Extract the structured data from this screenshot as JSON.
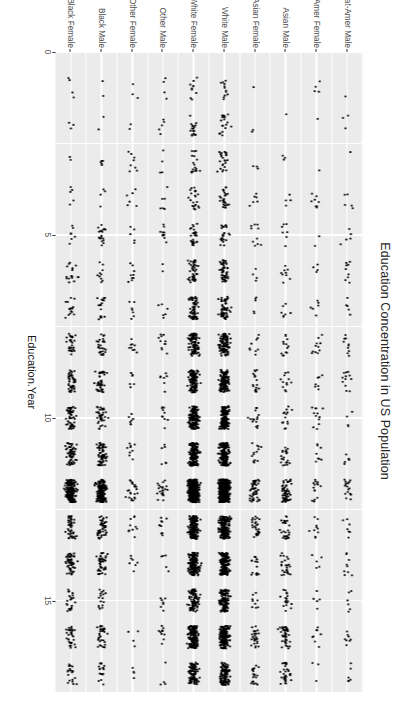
{
  "figure": {
    "title": "Education Concentration in US Population",
    "background": "#ffffff",
    "panel_background": "#ebebeb",
    "grid_color": "#ffffff",
    "point_color": "#000000",
    "axis_text_color": "#4d4d4d"
  },
  "chart_data": {
    "type": "scatter",
    "title": "Education Concentration in US Population",
    "subtitle": "",
    "orientation": "horizontal-strip",
    "xlabel": "Education.Year",
    "ylabel": "Race.Sex",
    "xlim": [
      0,
      17.5
    ],
    "ylim_categories": true,
    "grid": true,
    "legend": "none",
    "x_ticks": [
      {
        "value": 0,
        "label": "0"
      },
      {
        "value": 5,
        "label": "5"
      },
      {
        "value": 10,
        "label": "10"
      },
      {
        "value": 15,
        "label": "15"
      }
    ],
    "x_minor_ticks": [
      2.5,
      7.5,
      12.5
    ],
    "categories": [
      "Black Female",
      "Black Male",
      "Other Female",
      "Other Male",
      "White Female",
      "White Male",
      "Asian Female",
      "Asian Male",
      "Nat-Amer Female",
      "Nat-Amer Male"
    ],
    "series": [
      {
        "name": "Black Female",
        "n_points": 620,
        "density_scale": 0.62,
        "education_year_distribution": [
          {
            "year": 1,
            "weight": 0.004
          },
          {
            "year": 2,
            "weight": 0.006
          },
          {
            "year": 3,
            "weight": 0.008
          },
          {
            "year": 4,
            "weight": 0.012
          },
          {
            "year": 5,
            "weight": 0.014
          },
          {
            "year": 6,
            "weight": 0.022
          },
          {
            "year": 7,
            "weight": 0.028
          },
          {
            "year": 8,
            "weight": 0.05
          },
          {
            "year": 9,
            "weight": 0.07
          },
          {
            "year": 10,
            "weight": 0.085
          },
          {
            "year": 11,
            "weight": 0.1
          },
          {
            "year": 12,
            "weight": 0.3
          },
          {
            "year": 13,
            "weight": 0.095
          },
          {
            "year": 14,
            "weight": 0.085
          },
          {
            "year": 15,
            "weight": 0.035
          },
          {
            "year": 16,
            "weight": 0.055
          },
          {
            "year": 17,
            "weight": 0.031
          }
        ]
      },
      {
        "name": "Black Male",
        "n_points": 560,
        "density_scale": 0.58,
        "education_year_distribution": [
          {
            "year": 1,
            "weight": 0.004
          },
          {
            "year": 2,
            "weight": 0.006
          },
          {
            "year": 3,
            "weight": 0.01
          },
          {
            "year": 4,
            "weight": 0.014
          },
          {
            "year": 5,
            "weight": 0.016
          },
          {
            "year": 6,
            "weight": 0.024
          },
          {
            "year": 7,
            "weight": 0.03
          },
          {
            "year": 8,
            "weight": 0.055
          },
          {
            "year": 9,
            "weight": 0.075
          },
          {
            "year": 10,
            "weight": 0.09
          },
          {
            "year": 11,
            "weight": 0.1
          },
          {
            "year": 12,
            "weight": 0.3
          },
          {
            "year": 13,
            "weight": 0.09
          },
          {
            "year": 14,
            "weight": 0.075
          },
          {
            "year": 15,
            "weight": 0.03
          },
          {
            "year": 16,
            "weight": 0.048
          },
          {
            "year": 17,
            "weight": 0.033
          }
        ]
      },
      {
        "name": "Other Female",
        "n_points": 120,
        "density_scale": 0.12,
        "education_year_distribution": [
          {
            "year": 1,
            "weight": 0.02
          },
          {
            "year": 2,
            "weight": 0.02
          },
          {
            "year": 3,
            "weight": 0.03
          },
          {
            "year": 4,
            "weight": 0.035
          },
          {
            "year": 5,
            "weight": 0.04
          },
          {
            "year": 6,
            "weight": 0.05
          },
          {
            "year": 7,
            "weight": 0.05
          },
          {
            "year": 8,
            "weight": 0.06
          },
          {
            "year": 9,
            "weight": 0.07
          },
          {
            "year": 10,
            "weight": 0.075
          },
          {
            "year": 11,
            "weight": 0.08
          },
          {
            "year": 12,
            "weight": 0.17
          },
          {
            "year": 13,
            "weight": 0.08
          },
          {
            "year": 14,
            "weight": 0.08
          },
          {
            "year": 15,
            "weight": 0.045
          },
          {
            "year": 16,
            "weight": 0.06
          },
          {
            "year": 17,
            "weight": 0.035
          }
        ]
      },
      {
        "name": "Other Male",
        "n_points": 130,
        "density_scale": 0.13,
        "education_year_distribution": [
          {
            "year": 1,
            "weight": 0.02
          },
          {
            "year": 2,
            "weight": 0.022
          },
          {
            "year": 3,
            "weight": 0.03
          },
          {
            "year": 4,
            "weight": 0.04
          },
          {
            "year": 5,
            "weight": 0.045
          },
          {
            "year": 6,
            "weight": 0.05
          },
          {
            "year": 7,
            "weight": 0.05
          },
          {
            "year": 8,
            "weight": 0.06
          },
          {
            "year": 9,
            "weight": 0.07
          },
          {
            "year": 10,
            "weight": 0.075
          },
          {
            "year": 11,
            "weight": 0.08
          },
          {
            "year": 12,
            "weight": 0.16
          },
          {
            "year": 13,
            "weight": 0.08
          },
          {
            "year": 14,
            "weight": 0.075
          },
          {
            "year": 15,
            "weight": 0.045
          },
          {
            "year": 16,
            "weight": 0.058
          },
          {
            "year": 17,
            "weight": 0.045
          }
        ]
      },
      {
        "name": "White Female",
        "n_points": 2100,
        "density_scale": 1.0,
        "education_year_distribution": [
          {
            "year": 1,
            "weight": 0.004
          },
          {
            "year": 2,
            "weight": 0.006
          },
          {
            "year": 3,
            "weight": 0.009
          },
          {
            "year": 4,
            "weight": 0.012
          },
          {
            "year": 5,
            "weight": 0.016
          },
          {
            "year": 6,
            "weight": 0.022
          },
          {
            "year": 7,
            "weight": 0.028
          },
          {
            "year": 8,
            "weight": 0.05
          },
          {
            "year": 9,
            "weight": 0.06
          },
          {
            "year": 10,
            "weight": 0.07
          },
          {
            "year": 11,
            "weight": 0.085
          },
          {
            "year": 12,
            "weight": 0.28
          },
          {
            "year": 13,
            "weight": 0.095
          },
          {
            "year": 14,
            "weight": 0.09
          },
          {
            "year": 15,
            "weight": 0.04
          },
          {
            "year": 16,
            "weight": 0.08
          },
          {
            "year": 17,
            "weight": 0.053
          }
        ]
      },
      {
        "name": "White Male",
        "n_points": 2250,
        "density_scale": 1.0,
        "education_year_distribution": [
          {
            "year": 1,
            "weight": 0.005
          },
          {
            "year": 2,
            "weight": 0.007
          },
          {
            "year": 3,
            "weight": 0.01
          },
          {
            "year": 4,
            "weight": 0.013
          },
          {
            "year": 5,
            "weight": 0.017
          },
          {
            "year": 6,
            "weight": 0.023
          },
          {
            "year": 7,
            "weight": 0.03
          },
          {
            "year": 8,
            "weight": 0.05
          },
          {
            "year": 9,
            "weight": 0.062
          },
          {
            "year": 10,
            "weight": 0.072
          },
          {
            "year": 11,
            "weight": 0.085
          },
          {
            "year": 12,
            "weight": 0.27
          },
          {
            "year": 13,
            "weight": 0.09
          },
          {
            "year": 14,
            "weight": 0.088
          },
          {
            "year": 15,
            "weight": 0.042
          },
          {
            "year": 16,
            "weight": 0.082
          },
          {
            "year": 17,
            "weight": 0.054
          }
        ]
      },
      {
        "name": "Asian Female",
        "n_points": 240,
        "density_scale": 0.24,
        "education_year_distribution": [
          {
            "year": 1,
            "weight": 0.008
          },
          {
            "year": 2,
            "weight": 0.01
          },
          {
            "year": 3,
            "weight": 0.014
          },
          {
            "year": 4,
            "weight": 0.018
          },
          {
            "year": 5,
            "weight": 0.02
          },
          {
            "year": 6,
            "weight": 0.028
          },
          {
            "year": 7,
            "weight": 0.03
          },
          {
            "year": 8,
            "weight": 0.04
          },
          {
            "year": 9,
            "weight": 0.05
          },
          {
            "year": 10,
            "weight": 0.055
          },
          {
            "year": 11,
            "weight": 0.06
          },
          {
            "year": 12,
            "weight": 0.2
          },
          {
            "year": 13,
            "weight": 0.08
          },
          {
            "year": 14,
            "weight": 0.1
          },
          {
            "year": 15,
            "weight": 0.05
          },
          {
            "year": 16,
            "weight": 0.135
          },
          {
            "year": 17,
            "weight": 0.102
          }
        ]
      },
      {
        "name": "Asian Male",
        "n_points": 300,
        "density_scale": 0.3,
        "education_year_distribution": [
          {
            "year": 1,
            "weight": 0.008
          },
          {
            "year": 2,
            "weight": 0.01
          },
          {
            "year": 3,
            "weight": 0.013
          },
          {
            "year": 4,
            "weight": 0.017
          },
          {
            "year": 5,
            "weight": 0.02
          },
          {
            "year": 6,
            "weight": 0.026
          },
          {
            "year": 7,
            "weight": 0.03
          },
          {
            "year": 8,
            "weight": 0.04
          },
          {
            "year": 9,
            "weight": 0.05
          },
          {
            "year": 10,
            "weight": 0.05
          },
          {
            "year": 11,
            "weight": 0.058
          },
          {
            "year": 12,
            "weight": 0.19
          },
          {
            "year": 13,
            "weight": 0.078
          },
          {
            "year": 14,
            "weight": 0.1
          },
          {
            "year": 15,
            "weight": 0.05
          },
          {
            "year": 16,
            "weight": 0.15
          },
          {
            "year": 17,
            "weight": 0.11
          }
        ]
      },
      {
        "name": "Nat-Amer Female",
        "n_points": 110,
        "density_scale": 0.11,
        "education_year_distribution": [
          {
            "year": 1,
            "weight": 0.02
          },
          {
            "year": 2,
            "weight": 0.022
          },
          {
            "year": 3,
            "weight": 0.03
          },
          {
            "year": 4,
            "weight": 0.04
          },
          {
            "year": 5,
            "weight": 0.045
          },
          {
            "year": 6,
            "weight": 0.05
          },
          {
            "year": 7,
            "weight": 0.055
          },
          {
            "year": 8,
            "weight": 0.065
          },
          {
            "year": 9,
            "weight": 0.075
          },
          {
            "year": 10,
            "weight": 0.08
          },
          {
            "year": 11,
            "weight": 0.085
          },
          {
            "year": 12,
            "weight": 0.16
          },
          {
            "year": 13,
            "weight": 0.08
          },
          {
            "year": 14,
            "weight": 0.07
          },
          {
            "year": 15,
            "weight": 0.04
          },
          {
            "year": 16,
            "weight": 0.05
          },
          {
            "year": 17,
            "weight": 0.033
          }
        ]
      },
      {
        "name": "Nat-Amer Male",
        "n_points": 115,
        "density_scale": 0.115,
        "education_year_distribution": [
          {
            "year": 1,
            "weight": 0.02
          },
          {
            "year": 2,
            "weight": 0.024
          },
          {
            "year": 3,
            "weight": 0.032
          },
          {
            "year": 4,
            "weight": 0.042
          },
          {
            "year": 5,
            "weight": 0.046
          },
          {
            "year": 6,
            "weight": 0.052
          },
          {
            "year": 7,
            "weight": 0.056
          },
          {
            "year": 8,
            "weight": 0.066
          },
          {
            "year": 9,
            "weight": 0.076
          },
          {
            "year": 10,
            "weight": 0.08
          },
          {
            "year": 11,
            "weight": 0.085
          },
          {
            "year": 12,
            "weight": 0.155
          },
          {
            "year": 13,
            "weight": 0.075
          },
          {
            "year": 14,
            "weight": 0.068
          },
          {
            "year": 15,
            "weight": 0.038
          },
          {
            "year": 16,
            "weight": 0.048
          },
          {
            "year": 17,
            "weight": 0.037
          }
        ]
      }
    ]
  }
}
